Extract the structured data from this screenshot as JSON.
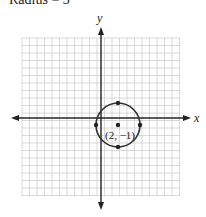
{
  "caption": "Radius = 3",
  "graph": {
    "x_axis_label": "x",
    "y_axis_label": "y",
    "center_label": "(2, −1)",
    "center": [
      2,
      -1
    ],
    "radius": 3,
    "points": [
      [
        2,
        2
      ],
      [
        2,
        -4
      ],
      [
        -1,
        -1
      ],
      [
        5,
        -1
      ]
    ],
    "colors": {
      "grid": "#c8c8c8",
      "axis": "#222222",
      "circle": "#333333"
    }
  }
}
